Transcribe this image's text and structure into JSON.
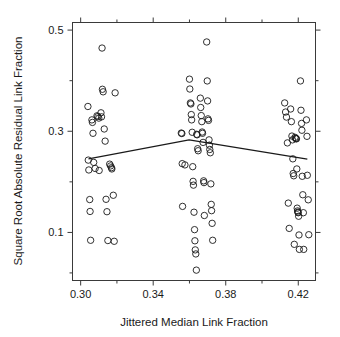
{
  "chart_data": {
    "type": "scatter",
    "title": "",
    "xlabel": "Jittered Median Link Fraction",
    "ylabel": "Square Root Absolute Residual Link Fraction",
    "xlim": [
      0.2955,
      0.4295
    ],
    "ylim": [
      0.005,
      0.515
    ],
    "grid": false,
    "legend": null,
    "x_ticks": [
      0.3,
      0.34,
      0.38,
      0.42
    ],
    "x_tick_labels": [
      "0.30",
      "0.34",
      "0.38",
      "0.42"
    ],
    "x_minor_ticks": [
      0.32,
      0.36,
      0.4
    ],
    "y_ticks": [
      0.1,
      0.3,
      0.5
    ],
    "y_tick_labels": [
      "0.1",
      "0.3",
      "0.5"
    ],
    "y_minor_ticks": [
      0.02,
      0.2,
      0.4
    ],
    "marker": "open-circle",
    "marker_size_px": 3.2,
    "series": [
      {
        "name": "observations",
        "points": [
          [
            0.304,
            0.349
          ],
          [
            0.3042,
            0.243
          ],
          [
            0.3045,
            0.2235
          ],
          [
            0.305,
            0.165
          ],
          [
            0.3052,
            0.1415
          ],
          [
            0.3055,
            0.0845
          ],
          [
            0.3062,
            0.3225
          ],
          [
            0.3065,
            0.3175
          ],
          [
            0.3068,
            0.296
          ],
          [
            0.3072,
            0.2385
          ],
          [
            0.308,
            0.2265
          ],
          [
            0.309,
            0.3305
          ],
          [
            0.3095,
            0.329
          ],
          [
            0.31,
            0.326
          ],
          [
            0.3102,
            0.2225
          ],
          [
            0.3112,
            0.3365
          ],
          [
            0.3115,
            0.3285
          ],
          [
            0.3118,
            0.4645
          ],
          [
            0.312,
            0.383
          ],
          [
            0.3124,
            0.378
          ],
          [
            0.313,
            0.3045
          ],
          [
            0.3135,
            0.2805
          ],
          [
            0.314,
            0.1655
          ],
          [
            0.3145,
            0.141
          ],
          [
            0.315,
            0.084
          ],
          [
            0.316,
            0.235
          ],
          [
            0.3165,
            0.2315
          ],
          [
            0.317,
            0.228
          ],
          [
            0.3172,
            0.2255
          ],
          [
            0.318,
            0.1735
          ],
          [
            0.3185,
            0.0825
          ],
          [
            0.319,
            0.376
          ],
          [
            0.3555,
            0.2965
          ],
          [
            0.3558,
            0.2955
          ],
          [
            0.356,
            0.236
          ],
          [
            0.3562,
            0.1515
          ],
          [
            0.3575,
            0.2335
          ],
          [
            0.36,
            0.403
          ],
          [
            0.3602,
            0.3835
          ],
          [
            0.3605,
            0.356
          ],
          [
            0.3608,
            0.354
          ],
          [
            0.361,
            0.333
          ],
          [
            0.3612,
            0.3225
          ],
          [
            0.3615,
            0.298
          ],
          [
            0.3618,
            0.23
          ],
          [
            0.362,
            0.201
          ],
          [
            0.3622,
            0.1935
          ],
          [
            0.3625,
            0.14
          ],
          [
            0.3628,
            0.1055
          ],
          [
            0.363,
            0.0835
          ],
          [
            0.3632,
            0.0655
          ],
          [
            0.3635,
            0.0575
          ],
          [
            0.3638,
            0.0255
          ],
          [
            0.364,
            0.294
          ],
          [
            0.3642,
            0.293
          ],
          [
            0.3645,
            0.2655
          ],
          [
            0.3648,
            0.2615
          ],
          [
            0.366,
            0.3655
          ],
          [
            0.3662,
            0.347
          ],
          [
            0.3665,
            0.331
          ],
          [
            0.3668,
            0.319
          ],
          [
            0.367,
            0.2985
          ],
          [
            0.3672,
            0.296
          ],
          [
            0.3675,
            0.278
          ],
          [
            0.3678,
            0.202
          ],
          [
            0.368,
            0.1985
          ],
          [
            0.3682,
            0.1335
          ],
          [
            0.3695,
            0.4765
          ],
          [
            0.3698,
            0.3995
          ],
          [
            0.37,
            0.36
          ],
          [
            0.3702,
            0.3245
          ],
          [
            0.3705,
            0.3215
          ],
          [
            0.3708,
            0.283
          ],
          [
            0.371,
            0.2725
          ],
          [
            0.3712,
            0.264
          ],
          [
            0.3715,
            0.2575
          ],
          [
            0.3718,
            0.196
          ],
          [
            0.372,
            0.1555
          ],
          [
            0.3722,
            0.143
          ],
          [
            0.3725,
            0.118
          ],
          [
            0.3728,
            0.0845
          ],
          [
            0.4125,
            0.356
          ],
          [
            0.413,
            0.338
          ],
          [
            0.4135,
            0.328
          ],
          [
            0.414,
            0.277
          ],
          [
            0.4145,
            0.158
          ],
          [
            0.415,
            0.108
          ],
          [
            0.4158,
            0.344
          ],
          [
            0.4162,
            0.319
          ],
          [
            0.4165,
            0.2905
          ],
          [
            0.4168,
            0.283
          ],
          [
            0.417,
            0.2455
          ],
          [
            0.4172,
            0.2165
          ],
          [
            0.4175,
            0.212
          ],
          [
            0.4178,
            0.0765
          ],
          [
            0.4182,
            0.288
          ],
          [
            0.4185,
            0.286
          ],
          [
            0.4188,
            0.2855
          ],
          [
            0.419,
            0.285
          ],
          [
            0.4192,
            0.2255
          ],
          [
            0.4194,
            0.148
          ],
          [
            0.4196,
            0.1425
          ],
          [
            0.4198,
            0.14
          ],
          [
            0.42,
            0.139
          ],
          [
            0.4202,
            0.132
          ],
          [
            0.4204,
            0.095
          ],
          [
            0.4206,
            0.0665
          ],
          [
            0.4212,
            0.3995
          ],
          [
            0.4215,
            0.3415
          ],
          [
            0.4218,
            0.3155
          ],
          [
            0.422,
            0.302
          ],
          [
            0.4222,
            0.211
          ],
          [
            0.4225,
            0.1745
          ],
          [
            0.4228,
            0.139
          ],
          [
            0.423,
            0.0665
          ],
          [
            0.4245,
            0.3225
          ],
          [
            0.4248,
            0.29
          ],
          [
            0.425,
            0.213
          ],
          [
            0.4255,
            0.1645
          ],
          [
            0.4258,
            0.0955
          ]
        ]
      }
    ],
    "trend_line": {
      "name": "lowess-trend",
      "points": [
        [
          0.3043,
          0.2455
        ],
        [
          0.3598,
          0.283
        ],
        [
          0.425,
          0.245
        ]
      ]
    }
  }
}
